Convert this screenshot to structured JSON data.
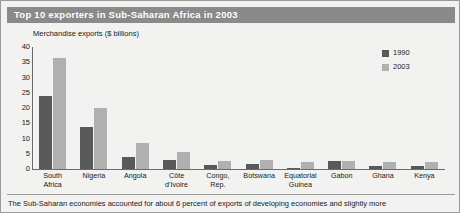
{
  "title": "Top 10 exporters in Sub-Saharan Africa in 2003",
  "footer": "The Sub-Saharan economies accounted for about 6 percent of exports of developing economies and slightly more",
  "legend": {
    "items": [
      {
        "label": "1990",
        "color": "#595959"
      },
      {
        "label": "2003",
        "color": "#b0b0b0"
      }
    ]
  },
  "chart_data": {
    "type": "bar",
    "title": "Top 10 exporters in Sub-Saharan Africa in 2003",
    "subtitle": "Merchandise exports ($ billions)",
    "xlabel": "",
    "ylabel": "Merchandise exports ($ billions)",
    "ylim": [
      0,
      40
    ],
    "yticks": [
      0,
      5,
      10,
      15,
      20,
      25,
      30,
      35,
      40
    ],
    "grid": false,
    "legend_position": "top-right",
    "categories": [
      "South Africa",
      "Nigeria",
      "Angola",
      "Côte d'Ivoire",
      "Congo, Rep.",
      "Botswana",
      "Equatorial Guinea",
      "Gabon",
      "Ghana",
      "Kenya"
    ],
    "series": [
      {
        "name": "1990",
        "color": "#595959",
        "values": [
          24.0,
          13.8,
          4.0,
          3.0,
          1.2,
          1.8,
          0.1,
          2.5,
          0.9,
          1.0
        ]
      },
      {
        "name": "2003",
        "color": "#b0b0b0",
        "values": [
          36.5,
          20.0,
          8.5,
          5.5,
          2.5,
          2.9,
          2.2,
          2.6,
          2.2,
          2.4
        ]
      }
    ]
  }
}
